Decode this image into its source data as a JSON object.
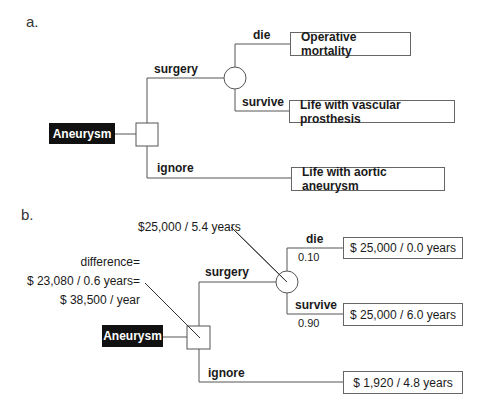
{
  "panel_a": {
    "label": "a.",
    "root": "Aneurysm",
    "decision_node": "square",
    "chance_node": "circle",
    "branches": {
      "surgery": "surgery",
      "ignore": "ignore",
      "die": "die",
      "survive": "survive"
    },
    "outcomes": {
      "die": "Operative mortality",
      "survive": "Life with vascular prosthesis",
      "ignore": "Life with aortic aneurysm"
    }
  },
  "panel_b": {
    "label": "b.",
    "root": "Aneurysm",
    "decision_node": "square",
    "chance_node": "circle",
    "branches": {
      "surgery": "surgery",
      "ignore": "ignore",
      "die": "die",
      "survive": "survive"
    },
    "probabilities": {
      "die": "0.10",
      "survive": "0.90"
    },
    "outcomes": {
      "die": "$ 25,000 / 0.0 years",
      "survive": "$ 25,000 / 6.0 years",
      "ignore": "$ 1,920 / 4.8 years"
    },
    "annotations": {
      "chance_value": "$25,000 / 5.4 years",
      "difference_line1": "difference=",
      "difference_line2": "$ 23,080 / 0.6 years=",
      "difference_line3": "$ 38,500 / year"
    }
  }
}
